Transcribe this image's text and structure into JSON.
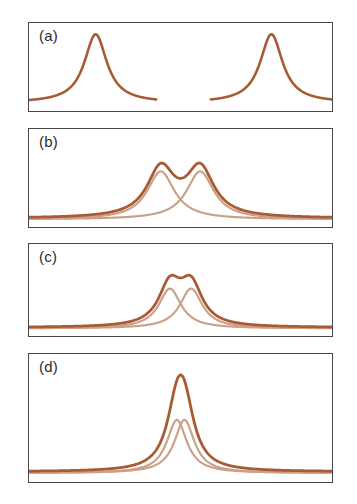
{
  "figure": {
    "background_color": "#ffffff",
    "frame_color": "#4a4a4a",
    "sum_curve_color": "#a85a32",
    "component_curve_color": "#cca088",
    "panel_labels": [
      "(a)",
      "(b)",
      "(c)",
      "(d)"
    ]
  },
  "chart_data": [
    {
      "type": "line",
      "panel": "(a)",
      "title": "",
      "xlabel": "",
      "ylabel": "",
      "xlim": [
        0,
        100
      ],
      "ylim": [
        0,
        1.15
      ],
      "grid": false,
      "legend": "none",
      "annotations": [
        "(a)"
      ],
      "description": "Two fully separated Lorentzian peaks; baseline is broken between them so each peak is drawn as its own isolated trace.",
      "series": [
        {
          "name": "left-peak",
          "color": "#a85a32",
          "peak_center": 22,
          "peak_height": 1.0,
          "half_width": 4.5,
          "x_range": [
            0,
            42
          ],
          "values": [
            0.04,
            0.05,
            0.06,
            0.08,
            0.11,
            0.16,
            0.25,
            0.42,
            0.72,
            0.98,
            1.0,
            0.78,
            0.47,
            0.28,
            0.18,
            0.12,
            0.09,
            0.07,
            0.05,
            0.04,
            0.04
          ]
        },
        {
          "name": "right-peak",
          "color": "#a85a32",
          "peak_center": 80,
          "peak_height": 1.0,
          "half_width": 4.5,
          "x_range": [
            60,
            100
          ],
          "values": [
            0.04,
            0.05,
            0.06,
            0.08,
            0.11,
            0.16,
            0.25,
            0.42,
            0.72,
            0.98,
            1.0,
            0.78,
            0.47,
            0.28,
            0.18,
            0.12,
            0.09,
            0.07,
            0.05,
            0.04,
            0.04
          ]
        }
      ]
    },
    {
      "type": "line",
      "panel": "(b)",
      "title": "",
      "xlabel": "",
      "ylabel": "",
      "xlim": [
        0,
        100
      ],
      "ylim": [
        0,
        1.35
      ],
      "grid": false,
      "legend": "none",
      "annotations": [
        "(b)"
      ],
      "description": "Two overlapping Lorentzian components (light) separated by about 2.2 half-widths plus their sum (dark); the doublet is well resolved with a deep valley.",
      "component_separation": 13,
      "valley_depth_fraction": 0.52,
      "series": [
        {
          "name": "component-1",
          "color": "#cca088",
          "peak_center": 43.5,
          "peak_height": 0.62,
          "half_width": 5.5
        },
        {
          "name": "component-2",
          "color": "#cca088",
          "peak_center": 56.5,
          "peak_height": 0.62,
          "half_width": 5.5
        },
        {
          "name": "sum",
          "color": "#a85a32",
          "peak_centers": [
            43.5,
            56.5
          ],
          "peak_height": 0.72,
          "valley_height": 0.46
        }
      ]
    },
    {
      "type": "line",
      "panel": "(c)",
      "title": "",
      "xlabel": "",
      "ylabel": "",
      "xlim": [
        0,
        100
      ],
      "ylim": [
        0,
        1.35
      ],
      "grid": false,
      "legend": "none",
      "annotations": [
        "(c)"
      ],
      "description": "Two Lorentzian components (light) separated by roughly one half-width plus their sum (dark); the sum is only marginally resolved, showing a shallow dip on a flat top.",
      "component_separation": 7,
      "valley_depth_fraction": 0.94,
      "series": [
        {
          "name": "component-1",
          "color": "#cca088",
          "peak_center": 46.5,
          "peak_height": 0.55,
          "half_width": 4.5
        },
        {
          "name": "component-2",
          "color": "#cca088",
          "peak_center": 53.5,
          "peak_height": 0.55,
          "half_width": 4.5
        },
        {
          "name": "sum",
          "color": "#a85a32",
          "peak_centers": [
            46.5,
            53.5
          ],
          "peak_height": 0.82,
          "valley_height": 0.77
        }
      ]
    },
    {
      "type": "line",
      "panel": "(d)",
      "title": "",
      "xlabel": "",
      "ylabel": "",
      "xlim": [
        0,
        100
      ],
      "ylim": [
        0,
        1.15
      ],
      "grid": false,
      "legend": "none",
      "annotations": [
        "(d)"
      ],
      "description": "Two nearly coincident Lorentzian components (light) plus their sum (dark); the components merge into one unresolved peak roughly twice as tall.",
      "component_separation": 2.5,
      "valley_depth_fraction": 1.0,
      "series": [
        {
          "name": "component-1",
          "color": "#cca088",
          "peak_center": 48.8,
          "peak_height": 0.5,
          "half_width": 4.0
        },
        {
          "name": "component-2",
          "color": "#cca088",
          "peak_center": 51.3,
          "peak_height": 0.5,
          "half_width": 4.0
        },
        {
          "name": "sum",
          "color": "#a85a32",
          "peak_center": 50,
          "peak_height": 0.98
        }
      ]
    }
  ]
}
